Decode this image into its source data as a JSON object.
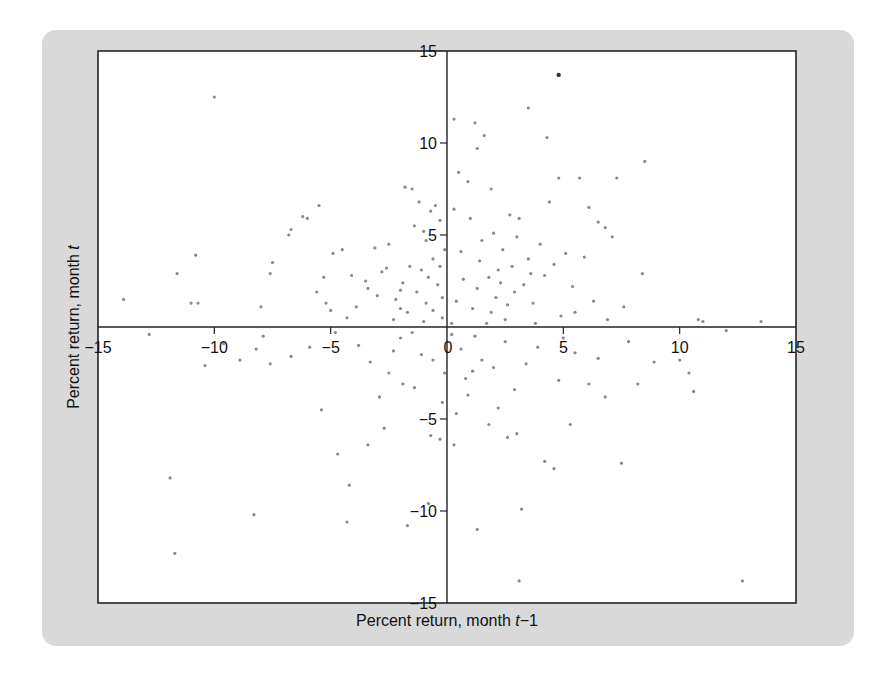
{
  "chart_data": {
    "type": "scatter",
    "title": "",
    "xlabel": "Percent return, month t−1",
    "xlabel_parts": {
      "prefix": "Percent return, month ",
      "var": "t",
      "suffix": "−1"
    },
    "ylabel": "Percent return, month t",
    "ylabel_parts": {
      "prefix": "Percent return, month ",
      "var": "t"
    },
    "xlim": [
      -15,
      15
    ],
    "ylim": [
      -15,
      15
    ],
    "grid": false,
    "legend": null,
    "axes_cross_at_origin": true,
    "x_ticks": [
      -15,
      -10,
      -5,
      0,
      5,
      10,
      15
    ],
    "y_ticks": [
      -15,
      -10,
      -5,
      0,
      5,
      10,
      15
    ],
    "x_tick_labels": [
      "−15",
      "−10",
      "−5",
      "0",
      "5",
      "10",
      "15"
    ],
    "y_tick_labels": [
      "−15",
      "−10",
      "−5",
      "0",
      "5",
      "10",
      "15"
    ],
    "colors": {
      "points": "#8a8a8a",
      "highlight_point": "#333333",
      "panel": "#d9d9d9",
      "axes": "#222222"
    },
    "highlight_point": {
      "x": 4.8,
      "y": 13.7
    },
    "points": [
      [
        -10.0,
        12.5
      ],
      [
        -13.9,
        1.5
      ],
      [
        -11.6,
        2.9
      ],
      [
        -11.0,
        1.3
      ],
      [
        -10.7,
        1.3
      ],
      [
        -10.8,
        3.9
      ],
      [
        -8.0,
        1.1
      ],
      [
        -7.6,
        2.9
      ],
      [
        -7.5,
        3.5
      ],
      [
        -6.8,
        5.0
      ],
      [
        -6.7,
        5.3
      ],
      [
        -6.2,
        6.0
      ],
      [
        -6.0,
        5.9
      ],
      [
        -5.5,
        6.6
      ],
      [
        -5.3,
        2.7
      ],
      [
        -5.2,
        1.3
      ],
      [
        -5.0,
        0.9
      ],
      [
        -5.6,
        1.9
      ],
      [
        -4.9,
        4.0
      ],
      [
        -4.5,
        4.2
      ],
      [
        -4.3,
        0.5
      ],
      [
        -3.5,
        2.5
      ],
      [
        -3.4,
        2.1
      ],
      [
        -3.1,
        4.3
      ],
      [
        -2.8,
        3.0
      ],
      [
        -2.5,
        4.5
      ],
      [
        -2.2,
        1.5
      ],
      [
        -2.0,
        1.0
      ],
      [
        -1.8,
        7.6
      ],
      [
        -1.5,
        7.5
      ],
      [
        -1.2,
        6.8
      ],
      [
        -1.4,
        5.5
      ],
      [
        -1.0,
        5.2
      ],
      [
        -0.9,
        4.7
      ],
      [
        -0.7,
        6.3
      ],
      [
        -0.5,
        6.6
      ],
      [
        -0.3,
        5.8
      ],
      [
        -0.1,
        4.2
      ],
      [
        -0.6,
        3.7
      ],
      [
        -1.1,
        3.1
      ],
      [
        -1.6,
        3.3
      ],
      [
        -1.9,
        2.4
      ],
      [
        -0.8,
        2.7
      ],
      [
        -0.4,
        2.3
      ],
      [
        -0.2,
        1.6
      ],
      [
        -0.9,
        1.3
      ],
      [
        -1.3,
        1.9
      ],
      [
        -1.7,
        0.8
      ],
      [
        -2.6,
        3.2
      ],
      [
        -3.0,
        1.7
      ],
      [
        -2.3,
        0.4
      ],
      [
        -1.0,
        0.3
      ],
      [
        -0.6,
        0.9
      ],
      [
        -0.2,
        0.5
      ],
      [
        0.3,
        11.3
      ],
      [
        1.2,
        11.1
      ],
      [
        1.6,
        10.4
      ],
      [
        1.3,
        9.7
      ],
      [
        0.9,
        7.9
      ],
      [
        1.9,
        7.5
      ],
      [
        2.7,
        6.1
      ],
      [
        0.5,
        8.4
      ],
      [
        0.3,
        6.4
      ],
      [
        1.0,
        5.9
      ],
      [
        1.5,
        4.7
      ],
      [
        2.0,
        5.1
      ],
      [
        2.4,
        4.2
      ],
      [
        3.0,
        4.9
      ],
      [
        3.5,
        3.7
      ],
      [
        2.8,
        3.3
      ],
      [
        2.2,
        3.1
      ],
      [
        1.8,
        2.7
      ],
      [
        1.3,
        2.1
      ],
      [
        0.7,
        2.6
      ],
      [
        0.4,
        1.4
      ],
      [
        1.1,
        1.0
      ],
      [
        2.1,
        1.6
      ],
      [
        2.9,
        1.9
      ],
      [
        3.3,
        2.3
      ],
      [
        3.7,
        1.3
      ],
      [
        4.2,
        2.8
      ],
      [
        4.6,
        3.4
      ],
      [
        5.1,
        4.0
      ],
      [
        5.4,
        2.2
      ],
      [
        5.9,
        3.8
      ],
      [
        4.0,
        4.5
      ],
      [
        3.1,
        5.9
      ],
      [
        4.4,
        6.8
      ],
      [
        4.8,
        8.1
      ],
      [
        4.3,
        10.3
      ],
      [
        3.5,
        11.9
      ],
      [
        5.7,
        8.1
      ],
      [
        6.8,
        5.4
      ],
      [
        7.3,
        8.1
      ],
      [
        8.5,
        9.0
      ],
      [
        8.4,
        2.9
      ],
      [
        6.1,
        6.5
      ],
      [
        6.5,
        5.7
      ],
      [
        7.1,
        4.9
      ],
      [
        7.6,
        1.1
      ],
      [
        6.9,
        0.4
      ],
      [
        6.3,
        1.4
      ],
      [
        5.5,
        0.8
      ],
      [
        11.0,
        0.3
      ],
      [
        13.5,
        0.3
      ],
      [
        0.2,
        0.2
      ],
      [
        1.7,
        0.2
      ],
      [
        2.5,
        0.4
      ],
      [
        3.8,
        0.2
      ],
      [
        4.9,
        0.6
      ],
      [
        -3.9,
        1.1
      ],
      [
        -4.1,
        2.8
      ],
      [
        -2.0,
        2.0
      ],
      [
        -0.3,
        3.3
      ],
      [
        0.6,
        4.1
      ],
      [
        1.4,
        3.6
      ],
      [
        2.3,
        2.4
      ],
      [
        3.6,
        2.9
      ],
      [
        2.6,
        1.2
      ],
      [
        1.9,
        0.8
      ],
      [
        -9.6,
        -0.9
      ],
      [
        -8.2,
        -1.2
      ],
      [
        -7.9,
        -0.5
      ],
      [
        -7.6,
        -2.0
      ],
      [
        -10.4,
        -2.1
      ],
      [
        -11.9,
        -8.2
      ],
      [
        -8.3,
        -10.2
      ],
      [
        -11.7,
        -12.3
      ],
      [
        -5.4,
        -4.5
      ],
      [
        -4.7,
        -6.9
      ],
      [
        -3.4,
        -6.4
      ],
      [
        -2.7,
        -5.5
      ],
      [
        -4.3,
        -10.6
      ],
      [
        -4.2,
        -8.6
      ],
      [
        -1.7,
        -10.8
      ],
      [
        -2.9,
        -3.8
      ],
      [
        -2.5,
        -2.5
      ],
      [
        -1.9,
        -3.1
      ],
      [
        -1.4,
        -3.3
      ],
      [
        -0.7,
        -5.9
      ],
      [
        -0.3,
        -6.1
      ],
      [
        -0.8,
        -9.6
      ],
      [
        -0.2,
        -4.1
      ],
      [
        -0.6,
        -1.8
      ],
      [
        -1.1,
        -1.5
      ],
      [
        -2.0,
        -0.6
      ],
      [
        -3.3,
        -1.9
      ],
      [
        0.2,
        -0.4
      ],
      [
        0.6,
        -1.2
      ],
      [
        1.1,
        -2.4
      ],
      [
        1.5,
        -1.8
      ],
      [
        2.0,
        -2.2
      ],
      [
        0.9,
        -3.7
      ],
      [
        0.4,
        -4.7
      ],
      [
        1.8,
        -5.3
      ],
      [
        2.2,
        -4.4
      ],
      [
        2.6,
        -6.0
      ],
      [
        3.0,
        -5.8
      ],
      [
        0.3,
        -6.4
      ],
      [
        1.3,
        -11.0
      ],
      [
        3.2,
        -9.9
      ],
      [
        3.1,
        -13.8
      ],
      [
        12.7,
        -13.8
      ],
      [
        4.2,
        -7.3
      ],
      [
        4.6,
        -7.7
      ],
      [
        5.3,
        -5.3
      ],
      [
        6.1,
        -3.1
      ],
      [
        6.8,
        -3.8
      ],
      [
        7.5,
        -7.4
      ],
      [
        8.2,
        -3.1
      ],
      [
        8.9,
        -1.9
      ],
      [
        10.0,
        -1.8
      ],
      [
        10.6,
        -3.5
      ],
      [
        10.4,
        -2.5
      ],
      [
        12.0,
        -0.2
      ],
      [
        7.8,
        -0.8
      ],
      [
        5.5,
        -1.4
      ],
      [
        4.8,
        -2.9
      ],
      [
        3.9,
        -1.1
      ],
      [
        3.4,
        -2.0
      ],
      [
        2.5,
        -0.8
      ],
      [
        1.2,
        -0.5
      ],
      [
        0.8,
        -2.8
      ],
      [
        2.9,
        -3.4
      ],
      [
        5.0,
        -0.6
      ],
      [
        6.5,
        -1.7
      ],
      [
        -0.1,
        -2.5
      ],
      [
        -1.5,
        -0.3
      ],
      [
        -2.3,
        -1.3
      ],
      [
        -3.8,
        -1.0
      ],
      [
        -4.8,
        -0.3
      ],
      [
        -5.9,
        -1.1
      ],
      [
        -6.7,
        -1.6
      ],
      [
        -8.9,
        -1.8
      ],
      [
        -12.8,
        -0.4
      ],
      [
        10.8,
        0.4
      ]
    ]
  }
}
